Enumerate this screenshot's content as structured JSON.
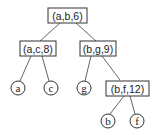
{
  "diagram": {
    "type": "tree",
    "nodes": {
      "root": {
        "label": "(a,b,6)",
        "shape": "box"
      },
      "left": {
        "label": "(a,c,8)",
        "shape": "box"
      },
      "right": {
        "label": "(b,g,9)",
        "shape": "box"
      },
      "right_right": {
        "label": "(b,f,12)",
        "shape": "box"
      },
      "leaf_a": {
        "label": "a",
        "shape": "circle"
      },
      "leaf_c": {
        "label": "c",
        "shape": "circle"
      },
      "leaf_g": {
        "label": "g",
        "shape": "circle"
      },
      "leaf_b": {
        "label": "b",
        "shape": "circle"
      },
      "leaf_f": {
        "label": "f",
        "shape": "circle"
      }
    },
    "edges": [
      [
        "root",
        "left"
      ],
      [
        "root",
        "right"
      ],
      [
        "left",
        "leaf_a"
      ],
      [
        "left",
        "leaf_c"
      ],
      [
        "right",
        "leaf_g"
      ],
      [
        "right",
        "right_right"
      ],
      [
        "right_right",
        "leaf_b"
      ],
      [
        "right_right",
        "leaf_f"
      ]
    ]
  }
}
